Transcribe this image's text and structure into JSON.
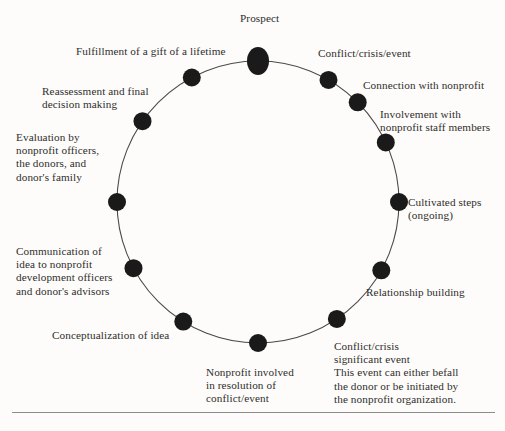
{
  "diagram": {
    "type": "cycle",
    "geometry": {
      "center_x": 258,
      "center_y": 202,
      "radius": 141
    },
    "style": {
      "background": "#fdfcfa",
      "node_color": "#1a1a1a",
      "ring_color": "#4a4a4a",
      "text_color": "#2f2d2c",
      "rule_color": "#8c8c8c"
    },
    "nodes": [
      {
        "id": "prospect",
        "label": "Prospect",
        "angle_deg": -90,
        "shape": "ellipse",
        "rx": 11,
        "ry": 14,
        "label_x": 240,
        "label_y": 12,
        "align": "c"
      },
      {
        "id": "conflict-crisis-event",
        "label": "Conflict/crisis/event",
        "angle_deg": -60,
        "shape": "circle",
        "r": 9,
        "label_x": 318,
        "label_y": 47,
        "align": "l"
      },
      {
        "id": "connection-with-nonprofit",
        "label": "Connection with nonprofit",
        "angle_deg": -45,
        "shape": "circle",
        "r": 9,
        "label_x": 363,
        "label_y": 79,
        "align": "l"
      },
      {
        "id": "involvement-with-nonprofit-staff",
        "label": "Involvement with\nnonprofit staff members",
        "angle_deg": -25,
        "shape": "circle",
        "r": 9,
        "label_x": 380,
        "label_y": 108,
        "align": "l"
      },
      {
        "id": "cultivated-steps",
        "label": "Cultivated steps\n(ongoing)",
        "angle_deg": 0,
        "shape": "circle",
        "r": 9,
        "label_x": 408,
        "label_y": 196,
        "align": "l"
      },
      {
        "id": "relationship-building",
        "label": "Relationship building",
        "angle_deg": 29,
        "shape": "circle",
        "r": 9,
        "label_x": 366,
        "label_y": 286,
        "align": "l"
      },
      {
        "id": "conflict-crisis-significant-event",
        "label": "Conflict/crisis\nsignificant event\nThis event can either befall\nthe donor or be initiated by\nthe nonprofit organization.",
        "angle_deg": 56,
        "shape": "circle",
        "r": 9,
        "label_x": 334,
        "label_y": 340,
        "align": "l"
      },
      {
        "id": "nonprofit-involved-resolution",
        "label": "Nonprofit involved\nin resolution of\nconflict/event",
        "angle_deg": 90,
        "shape": "circle",
        "r": 9,
        "label_x": 206,
        "label_y": 366,
        "align": "l"
      },
      {
        "id": "conceptualization-of-idea",
        "label": "Conceptualization of idea",
        "angle_deg": 122,
        "shape": "circle",
        "r": 9,
        "label_x": 52,
        "label_y": 329,
        "align": "l"
      },
      {
        "id": "communication-of-idea",
        "label": "Communication of\nidea to nonprofit\ndevelopment officers\nand donor's advisors",
        "angle_deg": 152,
        "shape": "circle",
        "r": 9,
        "label_x": 16,
        "label_y": 245,
        "align": "l"
      },
      {
        "id": "evaluation-by-nonprofit-officers",
        "label": "Evaluation by\nnonprofit officers,\nthe donors, and\ndonor's family",
        "angle_deg": 180,
        "shape": "circle",
        "r": 9,
        "label_x": 16,
        "label_y": 131,
        "align": "l"
      },
      {
        "id": "reassessment-and-final-decision",
        "label": "Reassessment and final\ndecision making",
        "angle_deg": -145,
        "shape": "circle",
        "r": 9,
        "label_x": 42,
        "label_y": 85,
        "align": "l"
      },
      {
        "id": "fulfillment-of-a-gift",
        "label": "Fulfillment of a gift of a lifetime",
        "angle_deg": -118,
        "shape": "circle",
        "r": 9,
        "label_x": 76,
        "label_y": 45,
        "align": "l"
      }
    ],
    "rule": {
      "x": 12,
      "y": 412,
      "width": 483
    }
  }
}
